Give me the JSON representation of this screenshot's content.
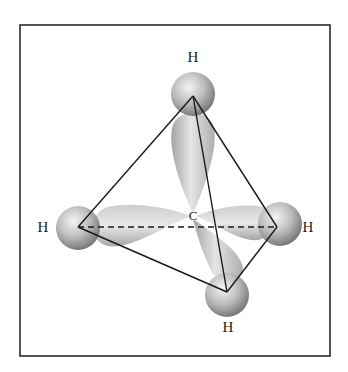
{
  "diagram": {
    "type": "molecular-orbital",
    "frame": {
      "x": 20,
      "y": 25,
      "width": 310,
      "height": 331
    },
    "center_atom": {
      "label": "C",
      "x": 193,
      "y": 216
    },
    "hydrogens": [
      {
        "id": "top",
        "label": "H",
        "vertex": [
          193,
          96
        ],
        "label_pos": [
          193,
          62
        ]
      },
      {
        "id": "left",
        "label": "H",
        "vertex": [
          78,
          227
        ],
        "label_pos": [
          43,
          232
        ]
      },
      {
        "id": "right",
        "label": "H",
        "vertex": [
          277,
          227
        ],
        "label_pos": [
          308,
          232
        ]
      },
      {
        "id": "bottom",
        "label": "H",
        "vertex": [
          227,
          292
        ],
        "label_pos": [
          228,
          332
        ]
      }
    ],
    "edges": [
      {
        "from": "top",
        "to": "left",
        "style": "solid"
      },
      {
        "from": "top",
        "to": "right",
        "style": "solid"
      },
      {
        "from": "top",
        "to": "bottom",
        "style": "solid"
      },
      {
        "from": "left",
        "to": "bottom",
        "style": "solid"
      },
      {
        "from": "right",
        "to": "bottom",
        "style": "solid"
      },
      {
        "from": "left",
        "to": "right",
        "style": "dashed"
      }
    ],
    "colors": {
      "line": "#1a1a1a",
      "orbital": "#b8b8b8",
      "sphere": "#a8a8a8",
      "frame": "#2a2a2a"
    }
  }
}
